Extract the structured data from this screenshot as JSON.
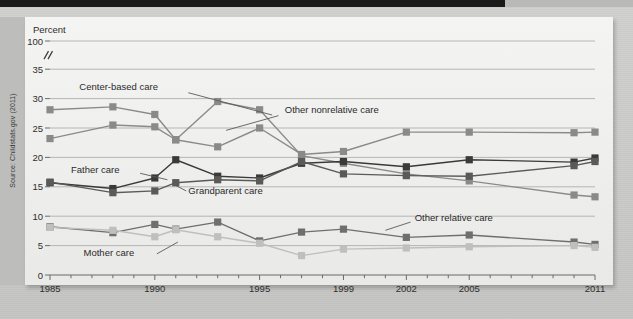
{
  "figure": {
    "y_axis_title": "Percent",
    "source_note": "Source: Childstats.gov (2011)"
  },
  "chart_data": {
    "type": "line",
    "title": "",
    "xlabel": "",
    "ylabel": "Percent",
    "grid": true,
    "legend_position": "inline-annotations",
    "axis_break": {
      "between": [
        35,
        100
      ],
      "symbol": "//"
    },
    "ylim": [
      0,
      100
    ],
    "yticks": [
      0,
      5,
      10,
      15,
      20,
      25,
      30,
      35,
      100
    ],
    "xlim": [
      1985,
      2011
    ],
    "xticks": [
      1985,
      1990,
      1995,
      1999,
      2002,
      2005,
      2011
    ],
    "xtick_labels": [
      "1985",
      "1990",
      "1995",
      "1999",
      "2002",
      "2005",
      "2011"
    ],
    "minor_xticks_every_year": true,
    "x": [
      1985,
      1988,
      1990,
      1991,
      1993,
      1995,
      1997,
      1999,
      2002,
      2005,
      2010,
      2011
    ],
    "series": [
      {
        "name": "Center-based care",
        "color": "#8a8a88",
        "label_x": 1986.4,
        "label_y": 31.4,
        "values": [
          23.2,
          25.5,
          25.2,
          23.0,
          21.8,
          25.0,
          20.5,
          21.0,
          24.3,
          24.3,
          24.2,
          24.3
        ]
      },
      {
        "name": "Other nonrelative care",
        "color": "#8a8a88",
        "label_x": 1996.2,
        "label_y": 27.6,
        "values": [
          28.1,
          28.6,
          27.3,
          23.0,
          29.5,
          28.1,
          20.3,
          19.0,
          17.2,
          16.0,
          13.6,
          13.3
        ]
      },
      {
        "name": "Father care",
        "color": "#3a3a38",
        "label_x": 1986.0,
        "label_y": 17.4,
        "values": [
          15.7,
          14.7,
          16.5,
          19.6,
          16.8,
          16.5,
          19.0,
          19.3,
          18.4,
          19.6,
          19.2,
          19.9
        ]
      },
      {
        "name": "Grandparent care",
        "color": "#5a5a58",
        "label_x": 1991.6,
        "label_y": 13.7,
        "values": [
          15.8,
          14.0,
          14.3,
          15.7,
          16.2,
          16.0,
          19.3,
          17.2,
          16.9,
          16.8,
          18.6,
          19.3
        ]
      },
      {
        "name": "Other relative care",
        "color": "#6f6f6d",
        "label_x": 2002.4,
        "label_y": 9.2,
        "values": [
          8.2,
          7.2,
          8.6,
          7.8,
          9.0,
          5.8,
          7.3,
          7.8,
          6.4,
          6.8,
          5.6,
          5.2
        ]
      },
      {
        "name": "Mother care",
        "color": "#bfbfbd",
        "label_x": 1986.6,
        "label_y": 3.2,
        "values": [
          8.1,
          7.6,
          6.5,
          7.7,
          6.5,
          5.4,
          3.3,
          4.4,
          4.6,
          4.8,
          5.0,
          4.7
        ]
      }
    ]
  }
}
